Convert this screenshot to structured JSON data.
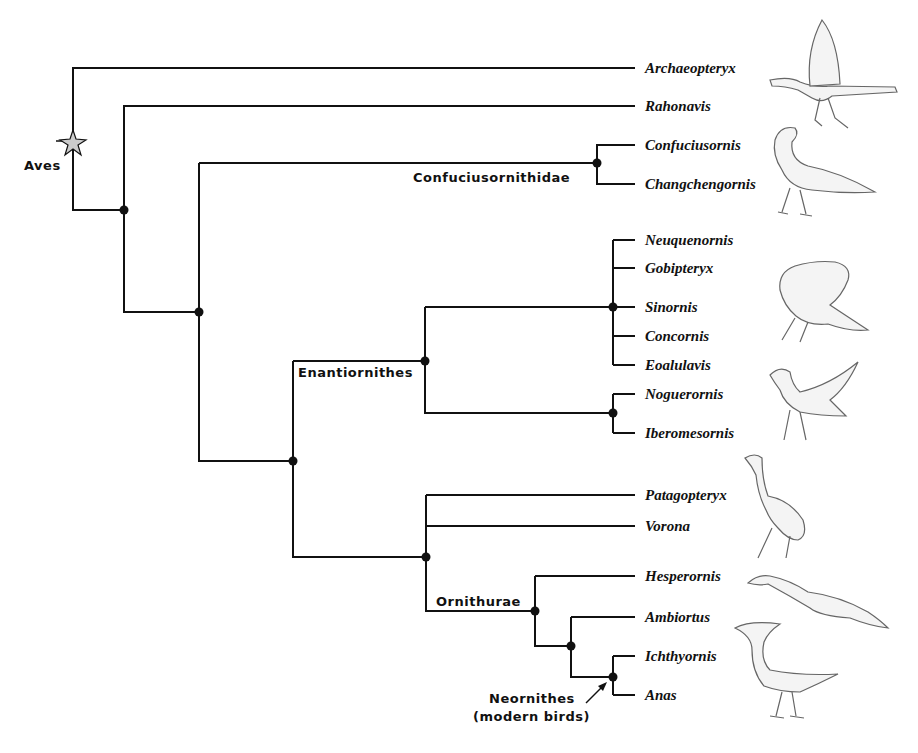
{
  "clades": {
    "aves": "Aves",
    "confuciusornithidae": "Confuciusornithidae",
    "enantiornithes": "Enantiornithes",
    "ornithurae": "Ornithurae",
    "neornithes_line1": "Neornithes",
    "neornithes_line2": "(modern birds)"
  },
  "taxa": [
    {
      "name": "Archaeopteryx",
      "y": 68
    },
    {
      "name": "Rahonavis",
      "y": 106
    },
    {
      "name": "Confuciusornis",
      "y": 145
    },
    {
      "name": "Changchengornis",
      "y": 184
    },
    {
      "name": "Neuquenornis",
      "y": 240
    },
    {
      "name": "Gobipteryx",
      "y": 268
    },
    {
      "name": "Sinornis",
      "y": 307
    },
    {
      "name": "Concornis",
      "y": 336
    },
    {
      "name": "Eoalulavis",
      "y": 365
    },
    {
      "name": "Noguerornis",
      "y": 394
    },
    {
      "name": "Iberomesornis",
      "y": 433
    },
    {
      "name": "Patagopteryx",
      "y": 495
    },
    {
      "name": "Vorona",
      "y": 526
    },
    {
      "name": "Hesperornis",
      "y": 576
    },
    {
      "name": "Ambiortus",
      "y": 617
    },
    {
      "name": "Ichthyornis",
      "y": 656
    },
    {
      "name": "Anas",
      "y": 695
    }
  ],
  "illustrations": [
    "archaeopteryx-illustration",
    "confuciusornis-illustration",
    "sinornis-illustration",
    "noguerornis-illustration",
    "patagopteryx-illustration",
    "hesperornis-illustration",
    "ichthyornis-illustration"
  ]
}
